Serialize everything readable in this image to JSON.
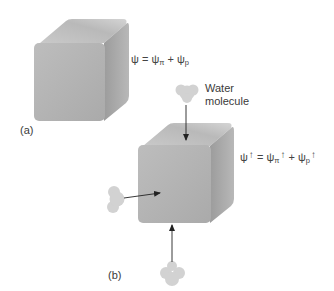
{
  "diagram": {
    "panel_a": {
      "label": "(a)",
      "equation": {
        "lhs": "ψ",
        "equals": "=",
        "term1": "ψ",
        "term1_sub": "π",
        "plus": "+",
        "term2": "ψ",
        "term2_sub": "p"
      }
    },
    "panel_b": {
      "label": "(b)",
      "water_label_line1": "Water",
      "water_label_line2": "molecule",
      "equation": {
        "lhs": "ψ",
        "lhs_arrow": "↑",
        "equals": "=",
        "term1": "ψ",
        "term1_sub": "π",
        "term1_arrow": "↑",
        "plus": "+",
        "term2": "ψ",
        "term2_sub": "p",
        "term2_arrow": "↑"
      },
      "water_molecules": 3
    },
    "colors": {
      "cube_front": "#b4b4b4",
      "cube_top": "#c6c6c6",
      "cube_side": "#a2a2a2",
      "molecule": "#d2d2d2",
      "arrow": "#222222"
    }
  }
}
